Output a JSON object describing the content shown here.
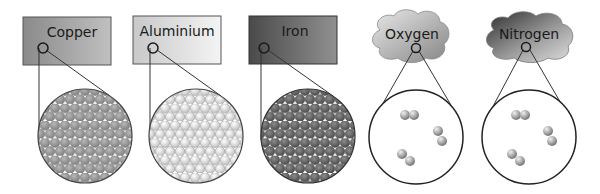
{
  "diagram": {
    "title": "",
    "metals": [
      {
        "label": "Copper",
        "box_color_start": "#8a8a8a",
        "box_color_end": "#bdbdbd",
        "atom_color": "#9a9a9a"
      },
      {
        "label": "Aluminium",
        "box_color_start": "#c9c9c9",
        "box_color_end": "#f2f2f2",
        "atom_color": "#e4e4e4"
      },
      {
        "label": "Iron",
        "box_color_start": "#4a4a4a",
        "box_color_end": "#8f8f8f",
        "atom_color": "#6a6a6a"
      }
    ],
    "gases": [
      {
        "label": "Oxygen",
        "cloud_color_start": "#d8d8d8",
        "cloud_color_end": "#8a8a8a",
        "molecules": 3
      },
      {
        "label": "Nitrogen",
        "cloud_color_start": "#3a3a3a",
        "cloud_color_end": "#d0d0d0",
        "molecules": 3
      }
    ]
  }
}
